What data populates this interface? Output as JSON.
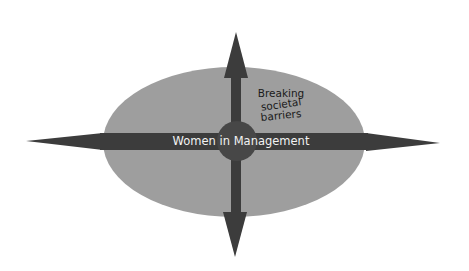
{
  "diagram": {
    "type": "ellipse-with-four-directional-arrows",
    "center_label": "Women in Management",
    "annotation_lines": [
      "Breaking",
      "societal",
      "barriers"
    ],
    "colors": {
      "background": "#ffffff",
      "ellipse_fill": "#9e9e9e",
      "arrow_fill": "#3c3c3c",
      "center_circle": "#474747",
      "label_text": "#f2f2f2",
      "annotation_text": "#1a1a1a"
    },
    "arrows": [
      {
        "direction": "up"
      },
      {
        "direction": "down"
      },
      {
        "direction": "left"
      },
      {
        "direction": "right"
      }
    ]
  }
}
